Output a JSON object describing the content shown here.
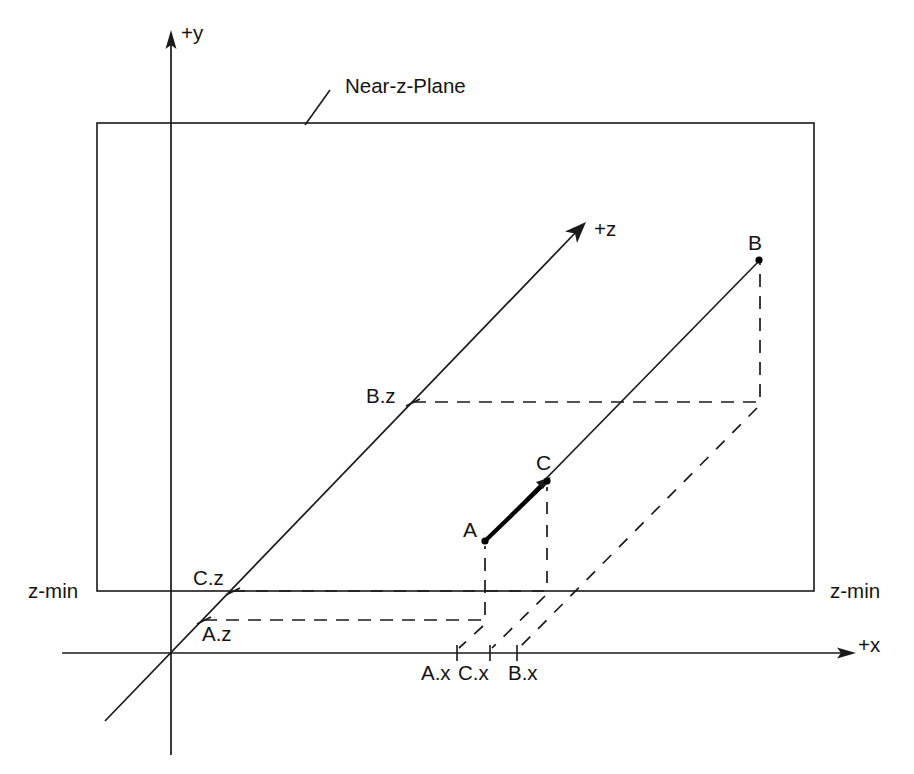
{
  "diagram": {
    "background_color": "#ffffff",
    "line_color": "#1a1a1a",
    "emphasis_color": "#000000",
    "axes": [
      {
        "id": "y-axis",
        "label": "+y",
        "direction": "up"
      },
      {
        "id": "x-axis",
        "label": "+x",
        "direction": "right"
      },
      {
        "id": "z-axis",
        "label": "+z",
        "direction": "up-right-diagonal"
      }
    ],
    "plane": {
      "label": "Near-z-Plane",
      "left_bound_label": "z-min",
      "right_bound_label": "z-min"
    },
    "points": [
      {
        "id": "A",
        "label": "A",
        "x_tick": "A.x",
        "z_tick": "A.z"
      },
      {
        "id": "B",
        "label": "B",
        "x_tick": "B.x",
        "z_tick": "B.z"
      },
      {
        "id": "C",
        "label": "C",
        "x_tick": "C.x",
        "z_tick": "C.z"
      }
    ],
    "labels": {
      "y_axis": "+y",
      "x_axis": "+x",
      "z_axis": "+z",
      "near_z_plane": "Near-z-Plane",
      "z_min_left": "z-min",
      "z_min_right": "z-min",
      "point_a": "A",
      "point_b": "B",
      "point_c": "C",
      "a_x": "A.x",
      "c_x": "C.x",
      "b_x": "B.x",
      "a_z": "A.z",
      "b_z": "B.z",
      "c_z": "C.z"
    }
  }
}
